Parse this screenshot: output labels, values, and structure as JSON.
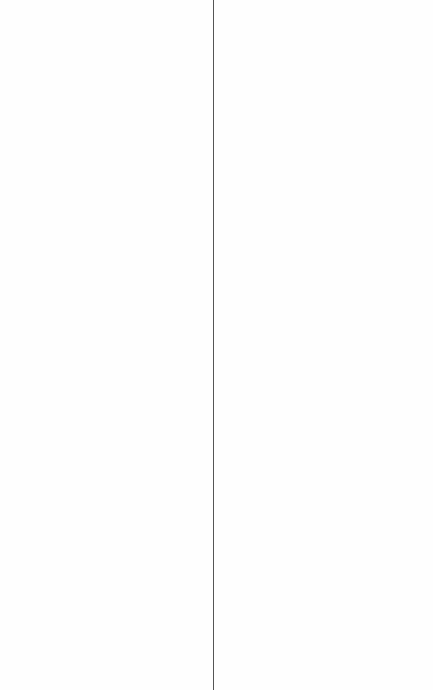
{
  "layout": {
    "divider_x": 213,
    "divider_color": "#555555",
    "background": "#ffffff"
  },
  "left_pane": {
    "content": ""
  },
  "right_pane": {
    "content": ""
  }
}
